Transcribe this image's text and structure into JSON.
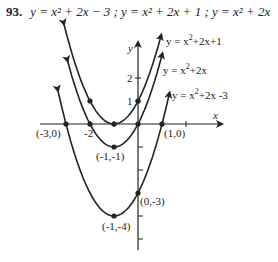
{
  "problem": {
    "number": "93.",
    "equations": "y = x² + 2x − 3 ; y = x² + 2x + 1 ; y = x² + 2x"
  },
  "chart_data": {
    "type": "line",
    "xlabel": "x",
    "ylabel": "y",
    "xlim": [
      -4,
      3
    ],
    "ylim": [
      -5,
      3.5
    ],
    "grid": false,
    "series": [
      {
        "name": "y = x^2+2x+1",
        "label": "y = x²+2x+1",
        "vertex": [
          -1,
          0
        ],
        "points": [
          [
            -2,
            1
          ],
          [
            -1,
            0
          ],
          [
            0,
            1
          ]
        ]
      },
      {
        "name": "y = x^2+2x",
        "label": "y = x²+2x",
        "vertex": [
          -1,
          -1
        ],
        "points": [
          [
            -2,
            0
          ],
          [
            -1,
            -1
          ],
          [
            0,
            0
          ]
        ]
      },
      {
        "name": "y = x^2+2x-3",
        "label": "y = x²+2x -3",
        "vertex": [
          -1,
          -4
        ],
        "points": [
          [
            -3,
            0
          ],
          [
            -1,
            -4
          ],
          [
            0,
            -3
          ],
          [
            1,
            0
          ]
        ]
      }
    ],
    "annotations": [
      "(-3,0)",
      "(1,0)",
      "(-1,-1)",
      "(0,-3)",
      "(-1,-4)"
    ],
    "x_ticks": [
      "-2"
    ],
    "y_ticks": [
      "1",
      "2"
    ]
  },
  "labels": {
    "curve1": "y = x",
    "curve1_tail": "+2x+1",
    "curve2": "y = x",
    "curve2_tail": "+2x",
    "curve3": "y = x",
    "curve3_tail": "+2x -3",
    "sup": "2",
    "xaxis": "x",
    "yaxis": "y",
    "tick_y1": "1",
    "tick_y2": "2",
    "tick_xm2": "-2",
    "pt_m30": "(-3,0)",
    "pt_10": "(1,0)",
    "pt_m1m1": "(-1,-1)",
    "pt_0m3": "(0,-3)",
    "pt_m1m4": "(-1,-4)"
  }
}
